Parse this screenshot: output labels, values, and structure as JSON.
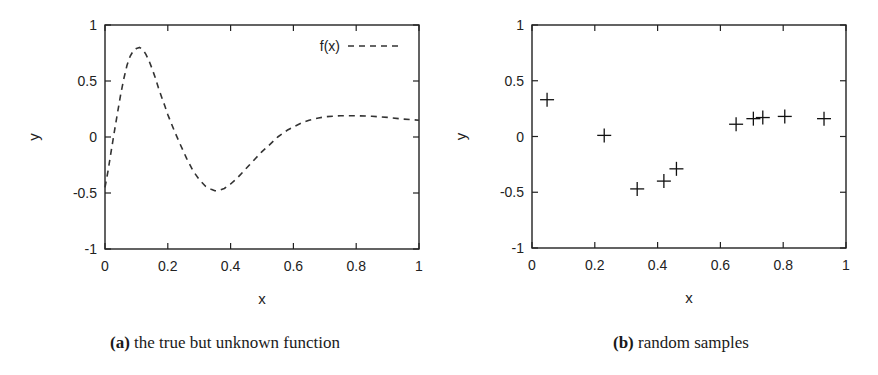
{
  "chart_data": [
    {
      "type": "line",
      "panel": "a",
      "title": "",
      "caption_tag": "(a)",
      "caption_text": "the true but unknown function",
      "xlabel": "x",
      "ylabel": "y",
      "xlim": [
        0,
        1
      ],
      "ylim": [
        -1,
        1
      ],
      "xticks": [
        0,
        0.2,
        0.4,
        0.6,
        0.8,
        1
      ],
      "xtick_labels": [
        "0",
        "0.2",
        "0.4",
        "0.6",
        "0.8",
        "1"
      ],
      "yticks": [
        -1,
        -0.5,
        0,
        0.5,
        1
      ],
      "ytick_labels": [
        "-1",
        "-0.5",
        "0",
        "0.5",
        "1"
      ],
      "grid": false,
      "legend": {
        "position": "top-right",
        "entries": [
          "f(x)"
        ]
      },
      "series": [
        {
          "name": "f(x)",
          "style": "dashed",
          "color": "#333333",
          "x": [
            0,
            0.01,
            0.02,
            0.03,
            0.04,
            0.05,
            0.06,
            0.07,
            0.08,
            0.09,
            0.1,
            0.11,
            0.12,
            0.13,
            0.14,
            0.15,
            0.16,
            0.17,
            0.18,
            0.19,
            0.2,
            0.22,
            0.24,
            0.26,
            0.28,
            0.3,
            0.32,
            0.34,
            0.35,
            0.36,
            0.38,
            0.4,
            0.42,
            0.44,
            0.46,
            0.48,
            0.5,
            0.52,
            0.55,
            0.58,
            0.6,
            0.63,
            0.65,
            0.68,
            0.7,
            0.75,
            0.8,
            0.85,
            0.9,
            0.95,
            1.0
          ],
          "y": [
            -0.45,
            -0.3,
            -0.12,
            0.05,
            0.22,
            0.38,
            0.52,
            0.64,
            0.72,
            0.77,
            0.79,
            0.8,
            0.78,
            0.74,
            0.68,
            0.61,
            0.53,
            0.44,
            0.36,
            0.28,
            0.2,
            0.06,
            -0.07,
            -0.19,
            -0.3,
            -0.38,
            -0.44,
            -0.47,
            -0.48,
            -0.48,
            -0.46,
            -0.42,
            -0.37,
            -0.31,
            -0.25,
            -0.19,
            -0.13,
            -0.08,
            0.0,
            0.06,
            0.09,
            0.13,
            0.15,
            0.17,
            0.18,
            0.19,
            0.19,
            0.185,
            0.175,
            0.16,
            0.15
          ]
        }
      ]
    },
    {
      "type": "scatter",
      "panel": "b",
      "title": "",
      "caption_tag": "(b)",
      "caption_text": "random samples",
      "xlabel": "x",
      "ylabel": "y",
      "xlim": [
        0,
        1
      ],
      "ylim": [
        -1,
        1
      ],
      "xticks": [
        0,
        0.2,
        0.4,
        0.6,
        0.8,
        1
      ],
      "xtick_labels": [
        "0",
        "0.2",
        "0.4",
        "0.6",
        "0.8",
        "1"
      ],
      "yticks": [
        -1,
        -0.5,
        0,
        0.5,
        1
      ],
      "ytick_labels": [
        "-1",
        "-0.5",
        "0",
        "0.5",
        "1"
      ],
      "grid": false,
      "marker": "+",
      "series": [
        {
          "name": "samples",
          "color": "#111111",
          "x": [
            0.048,
            0.23,
            0.335,
            0.42,
            0.46,
            0.65,
            0.705,
            0.735,
            0.805,
            0.93
          ],
          "y": [
            0.33,
            0.01,
            -0.47,
            -0.4,
            -0.29,
            0.11,
            0.16,
            0.17,
            0.18,
            0.16
          ]
        }
      ]
    }
  ],
  "captions": {
    "a": {
      "tag": "(a)",
      "text": "the true but unknown function"
    },
    "b": {
      "tag": "(b)",
      "text": "random samples"
    }
  }
}
